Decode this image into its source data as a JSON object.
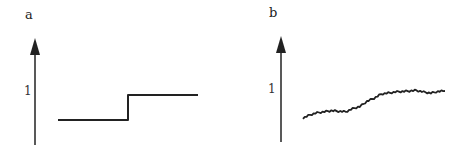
{
  "chart_data": [
    {
      "type": "line",
      "panel": "a",
      "title": "",
      "xlabel": "",
      "ylabel": "",
      "ytick_labels": [
        "1"
      ],
      "description": "Idealized step function: low constant level then abrupt jump to a higher constant level",
      "x": [
        0,
        0.5,
        0.5,
        1.0
      ],
      "values": [
        0.5,
        0.5,
        1.0,
        1.0
      ],
      "ylim": [
        0,
        2
      ]
    },
    {
      "type": "line",
      "panel": "b",
      "title": "",
      "xlabel": "",
      "ylabel": "",
      "ytick_labels": [
        "1"
      ],
      "description": "Noisy gradual rise (sigmoid-like) from lower level to ~1",
      "x": [
        0,
        0.05,
        0.1,
        0.15,
        0.2,
        0.25,
        0.3,
        0.35,
        0.4,
        0.45,
        0.5,
        0.55,
        0.6,
        0.65,
        0.7,
        0.75,
        0.8,
        0.85,
        0.9,
        0.95,
        1.0
      ],
      "values": [
        0.5,
        0.56,
        0.6,
        0.62,
        0.64,
        0.63,
        0.62,
        0.68,
        0.72,
        0.82,
        0.88,
        0.96,
        0.98,
        1.0,
        1.01,
        1.02,
        1.03,
        1.0,
        0.98,
        1.01,
        1.02
      ],
      "ylim": [
        0,
        2
      ]
    }
  ],
  "panels": {
    "a": {
      "label": "a",
      "tick": "1"
    },
    "b": {
      "label": "b",
      "tick": "1"
    }
  },
  "colors": {
    "stroke": "#222222"
  }
}
